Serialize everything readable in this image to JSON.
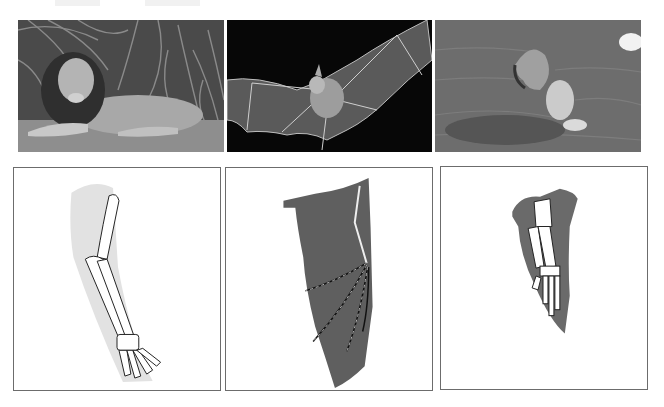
{
  "figure": {
    "top_text_fragments": [
      "",
      ""
    ],
    "photos": [
      {
        "subject": "lion",
        "icon": "lion-photo"
      },
      {
        "subject": "bat",
        "icon": "bat-photo"
      },
      {
        "subject": "dolphin",
        "icon": "dolphin-photo"
      }
    ],
    "diagrams": [
      {
        "subject": "lion forelimb skeleton",
        "icon": "lion-forelimb-diagram",
        "shade_color": "#e2e2e2"
      },
      {
        "subject": "bat wing skeleton",
        "icon": "bat-wing-diagram",
        "shade_color": "#5f5f5f"
      },
      {
        "subject": "dolphin flipper skeleton",
        "icon": "dolphin-flipper-diagram",
        "shade_color": "#6a6a6a"
      }
    ],
    "colors": {
      "panel_border": "#6c6c6c",
      "background": "#ffffff"
    }
  }
}
